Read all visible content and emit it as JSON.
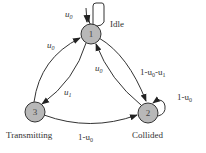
{
  "diagram": {
    "type": "state-transition",
    "nodes": [
      {
        "id": "1",
        "label": "1",
        "name": "Idle"
      },
      {
        "id": "2",
        "label": "2",
        "name": "Collided"
      },
      {
        "id": "3",
        "label": "3",
        "name": "Transmitting"
      }
    ],
    "edges": [
      {
        "from": "1",
        "to": "1",
        "label_main": "u",
        "label_sub": "0"
      },
      {
        "from": "1",
        "to": "2",
        "label_main": "1-u",
        "label_sub": "0",
        "label_tail_main": "-u",
        "label_tail_sub": "1"
      },
      {
        "from": "1",
        "to": "3",
        "label_main": "u",
        "label_sub": "1"
      },
      {
        "from": "2",
        "to": "1",
        "label_main": "u",
        "label_sub": "0"
      },
      {
        "from": "2",
        "to": "2",
        "label_main": "1-u",
        "label_sub": "0"
      },
      {
        "from": "3",
        "to": "1",
        "label_main": "u",
        "label_sub": "0"
      },
      {
        "from": "3",
        "to": "2",
        "label_main": "1-u",
        "label_sub": "0"
      }
    ],
    "colors": {
      "node_fill": "#b8b8b8",
      "stroke": "#333333",
      "background": "#ffffff"
    }
  }
}
